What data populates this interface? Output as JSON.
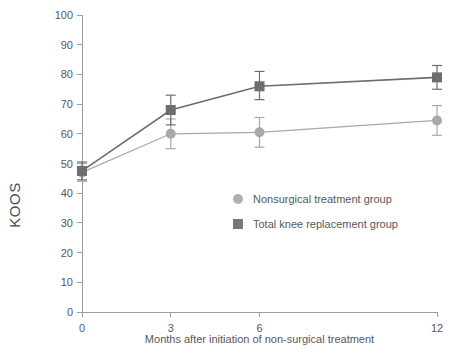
{
  "chart_data": {
    "type": "line",
    "title": "",
    "xlabel": "Months after initiation of non-surgical treatment",
    "ylabel": "KOOS",
    "xlim": [
      0,
      12
    ],
    "ylim": [
      0,
      100
    ],
    "x": [
      0,
      3,
      6,
      12
    ],
    "xticks": [
      "0",
      "3",
      "6",
      "12"
    ],
    "yticks": [
      "0",
      "10",
      "20",
      "30",
      "40",
      "50",
      "60",
      "70",
      "80",
      "90",
      "100"
    ],
    "grid": false,
    "legend_position": "center",
    "series": [
      {
        "name": "Nonsurgical treatment group",
        "marker": "circle",
        "color": "#a8a8aa",
        "values": [
          47,
          60,
          60.5,
          64.5
        ],
        "error_low": [
          3,
          5,
          5,
          5
        ],
        "error_high": [
          3,
          5,
          5,
          5
        ]
      },
      {
        "name": "Total knee replacement group",
        "marker": "square",
        "color": "#6d6d6f",
        "values": [
          47.5,
          68,
          76,
          79
        ],
        "error_low": [
          3,
          5,
          4.5,
          4
        ],
        "error_high": [
          3,
          5,
          5,
          4
        ]
      }
    ]
  },
  "legend": {
    "entries": [
      {
        "label": "Nonsurgical treatment group",
        "marker": "circle-marker",
        "color": "#b0b0b2"
      },
      {
        "label": "Total knee replacement group",
        "marker": "square-marker",
        "color": "#787879"
      }
    ]
  },
  "axes": {
    "y_title": "KOOS",
    "x_title": "Months after initiation of non-surgical treatment"
  }
}
